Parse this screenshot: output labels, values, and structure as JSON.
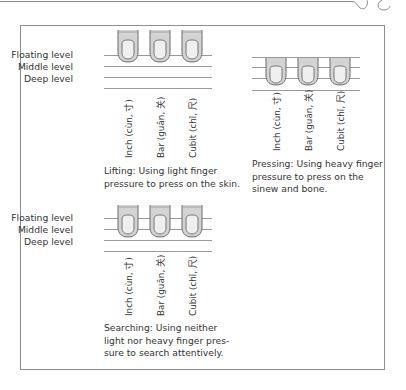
{
  "levels": {
    "floating": "Floating level",
    "middle": "Middle level",
    "deep": "Deep level"
  },
  "positions": {
    "inch": "Inch (cùn, 寸)",
    "bar": "Bar (guān, 关)",
    "cubit": "Cubit (chǐ, 尺)"
  },
  "panels": [
    {
      "id": "lifting",
      "caption_lines": [
        "Lifting: Using light finger",
        "pressure to press on the skin."
      ],
      "finger_level": "floating"
    },
    {
      "id": "pressing",
      "caption_lines": [
        "Pressing: Using heavy finger",
        "pressure to press on the",
        "sinew and bone."
      ],
      "finger_level": "deep"
    },
    {
      "id": "searching",
      "caption_lines": [
        "Searching: Using neither",
        "light nor heavy finger pres-",
        "sure to search attentively."
      ],
      "finger_level": "middle"
    }
  ],
  "colors": {
    "frame": "#8c8c8c",
    "line": "#9a9a9a",
    "finger_fill": "#d3d3d3",
    "finger_outline": "#6a6a6a",
    "nail_fill": "#efefef"
  }
}
